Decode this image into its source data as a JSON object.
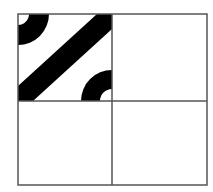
{
  "diagram": {
    "type": "truchet-tile-grid",
    "grid": {
      "rows": 2,
      "cols": 2,
      "x0": 18,
      "y0": 14,
      "x1": 207,
      "y1": 185,
      "mid_x": 112,
      "mid_y": 101,
      "line_color": "#555555",
      "line_width": 1.5
    },
    "tiles": [
      {
        "row": 0,
        "col": 0,
        "filled": true,
        "pattern": "corner-arcs-with-diagonal-band",
        "fill_color": "#000000",
        "elements": [
          {
            "kind": "quarter-ring",
            "corner": "top-left",
            "outer_radius": 31,
            "inner_radius": 11
          },
          {
            "kind": "diagonal-band",
            "from": "bottom-left",
            "to": "top-right",
            "width_along_edge": 15
          },
          {
            "kind": "quarter-ring",
            "corner": "bottom-right",
            "outer_radius": 31,
            "inner_radius": 12
          }
        ]
      },
      {
        "row": 0,
        "col": 1,
        "filled": false,
        "pattern": "blank"
      },
      {
        "row": 1,
        "col": 0,
        "filled": false,
        "pattern": "blank"
      },
      {
        "row": 1,
        "col": 1,
        "filled": false,
        "pattern": "blank"
      }
    ],
    "background_color": "#ffffff"
  }
}
